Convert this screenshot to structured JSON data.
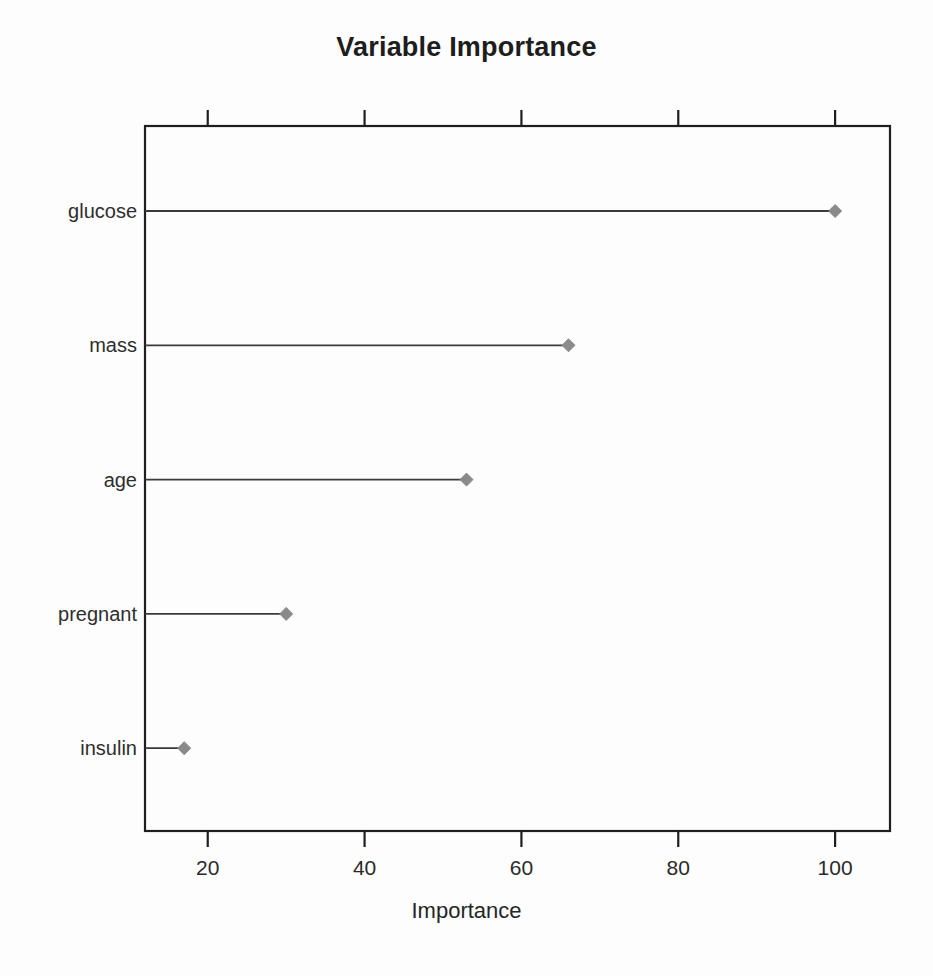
{
  "title": "Variable Importance",
  "x_axis_title": "Importance",
  "chart_data": {
    "type": "scatter",
    "plot_style": "dotchart",
    "title": "Variable Importance",
    "xlabel": "Importance",
    "ylabel": "",
    "categories": [
      "glucose",
      "mass",
      "age",
      "pregnant",
      "insulin"
    ],
    "values": [
      100,
      66,
      53,
      30,
      17
    ],
    "points": [
      {
        "label": "glucose",
        "value": 100
      },
      {
        "label": "mass",
        "value": 66
      },
      {
        "label": "age",
        "value": 53
      },
      {
        "label": "pregnant",
        "value": 30
      },
      {
        "label": "insulin",
        "value": 17
      }
    ],
    "xlim": [
      12,
      107
    ],
    "x_ticks": [
      20,
      40,
      60,
      80,
      100
    ],
    "x_tick_labels": [
      "20",
      "40",
      "60",
      "80",
      "100"
    ],
    "y_tick_labels": [
      "glucose",
      "mass",
      "age",
      "pregnant",
      "insulin"
    ],
    "grid": false,
    "legend": null,
    "marker": "diamond",
    "marker_color": "#8a8a8a",
    "line_color": "#3a3a3a",
    "axis_color": "#1e1e1e",
    "background_color": "#fdfdfd",
    "text_color": "#2a2a2a",
    "ticks_top": true,
    "ticks_bottom": true
  }
}
